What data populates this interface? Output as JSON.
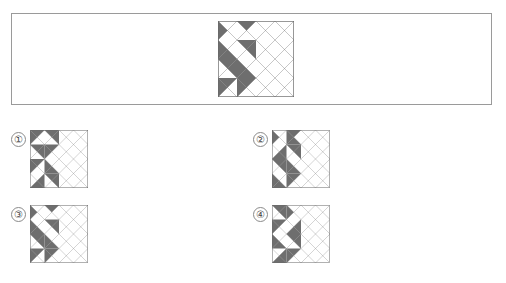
{
  "page": {
    "kind": "visual-reasoning-question",
    "background_color": "#ffffff",
    "width": 506,
    "height": 283
  },
  "colors": {
    "shade_gray": "#6e6e6e",
    "blank_white": "#ffffff",
    "stroke": "#6a6a6a",
    "frame_border": "#9a9a9a",
    "label_text": "#444444",
    "label_border": "#8a8a8a"
  },
  "question": {
    "frame": {
      "x": 11,
      "y": 13,
      "width": 481,
      "height": 92
    },
    "prompt_figure": {
      "name": "prompt-pattern",
      "x": 218,
      "y": 21,
      "size": 76,
      "grid": 4,
      "cell_triangles": [
        [
          "W",
          "W",
          "W",
          "N",
          "N",
          "W",
          "W",
          "W"
        ],
        [
          "W",
          "W",
          "N",
          "N",
          "N",
          "N",
          "W",
          "W"
        ],
        [
          "N",
          "N",
          "W",
          "W",
          "W",
          "W",
          "N",
          "N"
        ],
        [
          "N",
          "W",
          "W",
          "N",
          "N",
          "W",
          "W",
          "N"
        ],
        [
          "W",
          "N",
          "N",
          "W",
          "W",
          "N",
          "N",
          "W"
        ],
        [
          "N",
          "N",
          "W",
          "W",
          "W",
          "W",
          "N",
          "N"
        ],
        [
          "W",
          "W",
          "N",
          "N",
          "N",
          "N",
          "W",
          "W"
        ],
        [
          "N",
          "W",
          "W",
          "W",
          "W",
          "W",
          "W",
          "N"
        ]
      ]
    }
  },
  "options": [
    {
      "id": "option-1",
      "label": "①",
      "label_x": 11,
      "label_y": 132,
      "figure_x": 30,
      "figure_y": 130,
      "size": 58,
      "cell_triangles": [
        [
          "N",
          "W",
          "W",
          "N",
          "N",
          "N",
          "W",
          "W"
        ],
        [
          "N",
          "N",
          "W",
          "W",
          "N",
          "W",
          "W",
          "N"
        ],
        [
          "N",
          "W",
          "W",
          "N",
          "W",
          "W",
          "N",
          "N"
        ],
        [
          "W",
          "N",
          "N",
          "W",
          "N",
          "N",
          "W",
          "W"
        ],
        [
          "N",
          "W",
          "W",
          "N",
          "W",
          "N",
          "N",
          "W"
        ],
        [
          "W",
          "N",
          "N",
          "W",
          "N",
          "W",
          "W",
          "N"
        ],
        [
          "W",
          "W",
          "N",
          "N",
          "W",
          "N",
          "N",
          "W"
        ],
        [
          "N",
          "N",
          "W",
          "W",
          "W",
          "W",
          "N",
          "N"
        ]
      ]
    },
    {
      "id": "option-2",
      "label": "②",
      "label_x": 253,
      "label_y": 132,
      "figure_x": 272,
      "figure_y": 130,
      "size": 58,
      "cell_triangles": [
        [
          "W",
          "W",
          "W",
          "N",
          "N",
          "W",
          "N",
          "N"
        ],
        [
          "W",
          "N",
          "N",
          "W",
          "N",
          "N",
          "W",
          "W"
        ],
        [
          "N",
          "N",
          "W",
          "W",
          "W",
          "W",
          "N",
          "N"
        ],
        [
          "W",
          "W",
          "N",
          "N",
          "N",
          "W",
          "W",
          "N"
        ],
        [
          "N",
          "W",
          "W",
          "N",
          "W",
          "N",
          "N",
          "W"
        ],
        [
          "N",
          "N",
          "W",
          "W",
          "W",
          "W",
          "N",
          "N"
        ],
        [
          "W",
          "W",
          "N",
          "N",
          "N",
          "N",
          "W",
          "W"
        ],
        [
          "N",
          "W",
          "W",
          "N",
          "N",
          "W",
          "W",
          "N"
        ]
      ]
    },
    {
      "id": "option-3",
      "label": "③",
      "label_x": 11,
      "label_y": 207,
      "figure_x": 30,
      "figure_y": 205,
      "size": 58,
      "cell_triangles": [
        [
          "W",
          "W",
          "W",
          "N",
          "N",
          "W",
          "W",
          "W"
        ],
        [
          "W",
          "W",
          "N",
          "N",
          "N",
          "N",
          "W",
          "W"
        ],
        [
          "N",
          "N",
          "W",
          "W",
          "W",
          "W",
          "N",
          "N"
        ],
        [
          "N",
          "W",
          "W",
          "N",
          "N",
          "W",
          "W",
          "N"
        ],
        [
          "W",
          "N",
          "N",
          "W",
          "W",
          "N",
          "N",
          "W"
        ],
        [
          "N",
          "N",
          "W",
          "W",
          "W",
          "W",
          "N",
          "N"
        ],
        [
          "W",
          "W",
          "N",
          "N",
          "N",
          "N",
          "W",
          "W"
        ],
        [
          "N",
          "W",
          "W",
          "W",
          "W",
          "W",
          "W",
          "N"
        ]
      ]
    },
    {
      "id": "option-4",
      "label": "④",
      "label_x": 253,
      "label_y": 207,
      "figure_x": 272,
      "figure_y": 205,
      "size": 58,
      "cell_triangles": [
        [
          "N",
          "N",
          "W",
          "W",
          "W",
          "W",
          "W",
          "N"
        ],
        [
          "N",
          "W",
          "W",
          "N",
          "W",
          "N",
          "N",
          "W"
        ],
        [
          "W",
          "W",
          "N",
          "N",
          "N",
          "N",
          "W",
          "W"
        ],
        [
          "W",
          "N",
          "N",
          "W",
          "N",
          "W",
          "W",
          "N"
        ],
        [
          "N",
          "W",
          "W",
          "N",
          "W",
          "N",
          "N",
          "W"
        ],
        [
          "N",
          "N",
          "W",
          "W",
          "W",
          "W",
          "N",
          "N"
        ],
        [
          "W",
          "W",
          "N",
          "N",
          "N",
          "N",
          "W",
          "W"
        ],
        [
          "N",
          "W",
          "W",
          "W",
          "W",
          "W",
          "W",
          "N"
        ]
      ]
    }
  ]
}
